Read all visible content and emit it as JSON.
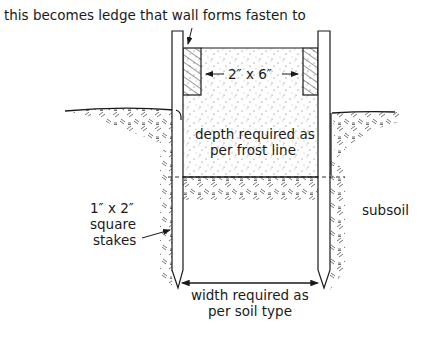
{
  "diagram": {
    "labels": {
      "ledge": "this becomes ledge that wall forms fasten to",
      "board": "2″ x 6″",
      "depth_line1": "depth required as",
      "depth_line2": "per frost line",
      "stakes_line1": "1″ x 2″",
      "stakes_line2": "square",
      "stakes_line3": "stakes",
      "subsoil": "subsoil",
      "width_line1": "width required as",
      "width_line2": "per soil type"
    },
    "components": [
      "left-stake",
      "right-stake",
      "left-2x6-board",
      "right-2x6-board",
      "concrete-fill",
      "trench",
      "grade-surface",
      "frost-line",
      "width-dimension"
    ],
    "colors": {
      "ink": "#1a1a1a",
      "background": "#ffffff"
    }
  }
}
